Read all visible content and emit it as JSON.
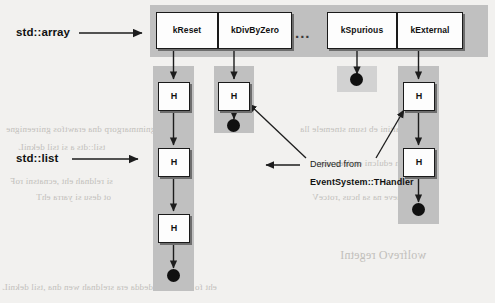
{
  "figure": {
    "labels": {
      "array_label": "std::array",
      "list_label": "std::list"
    },
    "ellipsis": "...",
    "legend": {
      "line1": "Derived from",
      "line2": "EventSystem::THandler"
    },
    "array_slots": [
      {
        "name": "kReset",
        "handler_count": 3
      },
      {
        "name": "kDivByZero",
        "handler_count": 1
      },
      {
        "name": "kSpurious",
        "handler_count": 0
      },
      {
        "name": "kExternal",
        "handler_count": 2
      }
    ],
    "handler_node_label": "H",
    "colors": {
      "page_background": "#f2f1ef",
      "panel_gray": "#c0c0c0",
      "panel_gray_light": "#d2d2d2",
      "node_fill": "#fdfdfd",
      "node_border": "#1a1a1a",
      "node_shadow": "#6d6d6d",
      "terminator": "#101010",
      "text": "#111111",
      "bleed_text": "#b9b7b3"
    },
    "background_bleed": [
      "gnimmargorp dna erawtfos gnireenigne",
      "tsil::dts a si tsil dekniL",
      "si reldnah eht ,ecnatsni roF",
      "ot desu si yarra ehT",
      "dezilaitini eb tsum stnemele lla",
      "redaeh edulcni ot deen uoy",
      "tneve na sa hcus ,rotceV",
      "wolfrevO regetnI",
      "eht fo dne eht ta dedda era sreldnah wen dna ,tsil dekniL"
    ]
  }
}
